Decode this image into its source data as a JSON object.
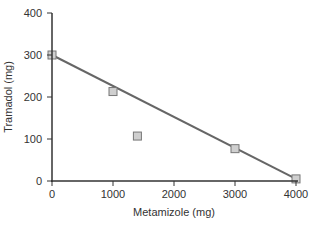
{
  "chart_data": {
    "type": "scatter",
    "title": "",
    "xlabel": "Metamizole (mg)",
    "ylabel": "Tramadol (mg)",
    "xlim": [
      0,
      4000
    ],
    "ylim": [
      0,
      400
    ],
    "xticks": [
      0,
      1000,
      2000,
      3000,
      4000
    ],
    "yticks": [
      0,
      100,
      200,
      300,
      400
    ],
    "xtick_labels": [
      "0",
      "1000",
      "2000",
      "3000",
      "4000"
    ],
    "ytick_labels": [
      "0",
      "100",
      "200",
      "300",
      "400"
    ],
    "grid": false,
    "legend": null,
    "series": [
      {
        "name": "data points",
        "type": "scatter",
        "marker": "square",
        "points": [
          {
            "x": 0,
            "y": 300
          },
          {
            "x": 1000,
            "y": 213
          },
          {
            "x": 1400,
            "y": 107
          },
          {
            "x": 3000,
            "y": 77
          },
          {
            "x": 4000,
            "y": 5
          }
        ]
      },
      {
        "name": "line of additivity",
        "type": "line",
        "points": [
          {
            "x": 0,
            "y": 300
          },
          {
            "x": 4000,
            "y": 5
          }
        ]
      }
    ],
    "colors": {
      "axis": "#333333",
      "line": "#666666",
      "marker_fill": "#cfcfcf",
      "marker_stroke": "#777777"
    }
  }
}
